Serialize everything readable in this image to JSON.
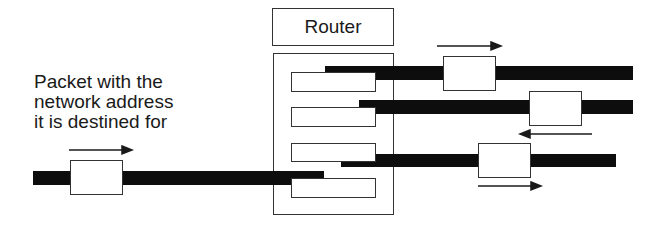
{
  "diagram": {
    "router": {
      "label": "Router",
      "port_count": 4
    },
    "annotation": {
      "lines": [
        "Packet with the",
        "network address",
        "it is destined for"
      ]
    },
    "packets": [
      {
        "id": "incoming",
        "direction": "right"
      },
      {
        "id": "outgoing-1",
        "direction": "right"
      },
      {
        "id": "outgoing-2",
        "direction": "left"
      },
      {
        "id": "outgoing-3",
        "direction": "right"
      }
    ],
    "colors": {
      "wire": "#0d0d0d",
      "outline": "#333333",
      "background": "#ffffff"
    }
  }
}
